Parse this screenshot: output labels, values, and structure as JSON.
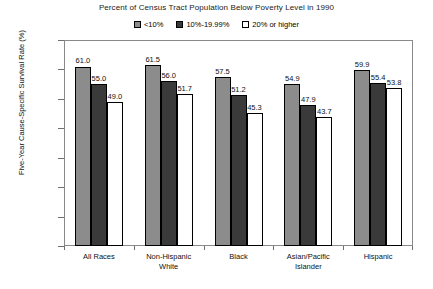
{
  "chart_data": {
    "type": "bar",
    "title": "Percent of Census Tract Population Below Poverty Level in 1990",
    "xlabel": "",
    "ylabel": "Five-Year Cause-Specific Survival Rate (%)",
    "ylim": [
      0.0,
      70.0
    ],
    "ytick_step": 10.0,
    "ytick_labels": [
      "70.0",
      "60.0",
      "50.0",
      "40.0",
      "30.0",
      "20.0",
      "10.0",
      "0.0"
    ],
    "ytick_values": [
      70.0,
      60.0,
      50.0,
      40.0,
      30.0,
      20.0,
      10.0,
      0.0
    ],
    "grid": false,
    "legend_position": "top-center",
    "categories": [
      "All Races",
      "Non-Hispanic White",
      "Black",
      "Asian/Pacific Islander",
      "Hispanic"
    ],
    "category_lines": [
      [
        "All Races"
      ],
      [
        "Non-Hispanic",
        "White"
      ],
      [
        "Black"
      ],
      [
        "Asian/Pacific",
        "Islander"
      ],
      [
        "Hispanic"
      ]
    ],
    "series": [
      {
        "name": "<10%",
        "color": "#8c8c8c",
        "values": [
          61.0,
          61.5,
          57.5,
          54.9,
          59.9
        ],
        "labels": [
          "61.0",
          "61.5",
          "57.5",
          "54.9",
          "59.9"
        ]
      },
      {
        "name": "10%-19.99%",
        "color": "#3a3a3a",
        "values": [
          55.0,
          56.0,
          51.2,
          47.9,
          55.4
        ],
        "labels": [
          "55.0",
          "56.0",
          "51.2",
          "47.9",
          "55.4"
        ]
      },
      {
        "name": "20% or higher",
        "color": "#ffffff",
        "values": [
          49.0,
          51.7,
          45.3,
          43.7,
          53.8
        ],
        "labels": [
          "49.0",
          "51.7",
          "45.3",
          "43.7",
          "53.8"
        ]
      }
    ]
  },
  "legend": {
    "items": [
      {
        "label": "<10%",
        "swatch": "legend-swatch-light"
      },
      {
        "label": "10%-19.99%",
        "swatch": "legend-swatch-dark"
      },
      {
        "label": "20% or higher",
        "swatch": "legend-swatch-white"
      }
    ]
  },
  "colors": {
    "series_light": "#8c8c8c",
    "series_dark": "#3a3a3a",
    "series_white": "#ffffff",
    "frame": "#8a8a8a",
    "text": "#111111",
    "background": "#ffffff"
  }
}
